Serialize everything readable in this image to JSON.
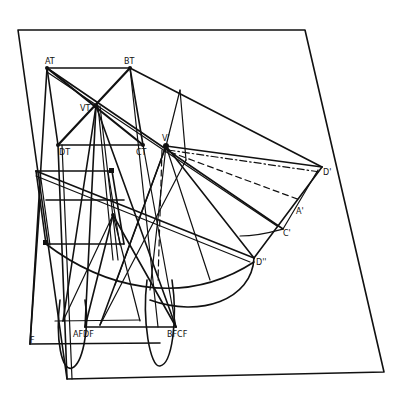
{
  "figure": {
    "colors": {
      "ink": "#111111",
      "paper": "#ffffff"
    },
    "labels": {
      "A_T": "AT",
      "B_T": "BT",
      "V_T": "VT",
      "D_T": "DT",
      "C_T": "CT",
      "V_prime": "V'",
      "D_prime": "D'",
      "C_prime": "C'",
      "A_prime": "A'",
      "D_dprime": "D''",
      "A_F_D_F": "AFDF",
      "B_F_C_F": "BFCF",
      "F": "F"
    },
    "points": {
      "frame_tl": [
        18,
        30
      ],
      "frame_tr": [
        305,
        30
      ],
      "frame_br": [
        384,
        372
      ],
      "frame_bl": [
        67,
        379
      ],
      "A_T": [
        47,
        68
      ],
      "B_T": [
        130,
        68
      ],
      "V_T": [
        96,
        106
      ],
      "D_T": [
        58,
        145
      ],
      "C_T": [
        143,
        145
      ],
      "V_prime": [
        166,
        146
      ],
      "D_prime": [
        322,
        167
      ],
      "C_prime": [
        283,
        229
      ],
      "D_dprime": [
        254,
        258
      ],
      "A_F": [
        85,
        327
      ],
      "B_F": [
        176,
        327
      ],
      "F": [
        30,
        344
      ]
    }
  }
}
